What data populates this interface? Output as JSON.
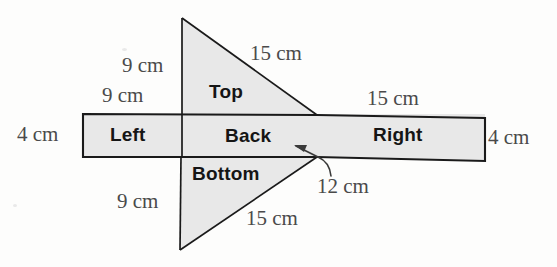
{
  "figure": {
    "type": "geometry-net-diagram",
    "fill_color": "#e8e8e8",
    "stroke_color": "#1a1a1a",
    "label_color": "#4a4a4a",
    "face_label_color": "#151515"
  },
  "faces": [
    {
      "id": "left",
      "label": "Left"
    },
    {
      "id": "back",
      "label": "Back"
    },
    {
      "id": "right",
      "label": "Right"
    },
    {
      "id": "top",
      "label": "Top"
    },
    {
      "id": "bottom",
      "label": "Bottom"
    }
  ],
  "dimensions": [
    {
      "id": "top-vertical-9",
      "text": "9 cm"
    },
    {
      "id": "left-width-9",
      "text": "9 cm"
    },
    {
      "id": "top-hypotenuse-15",
      "text": "15 cm"
    },
    {
      "id": "right-width-15",
      "text": "15 cm"
    },
    {
      "id": "left-height-4",
      "text": "4 cm"
    },
    {
      "id": "right-height-4",
      "text": "4 cm"
    },
    {
      "id": "bottom-vertical-9",
      "text": "9 cm"
    },
    {
      "id": "bottom-hypotenuse-15",
      "text": "15 cm"
    },
    {
      "id": "back-width-12",
      "text": "12 cm"
    }
  ]
}
